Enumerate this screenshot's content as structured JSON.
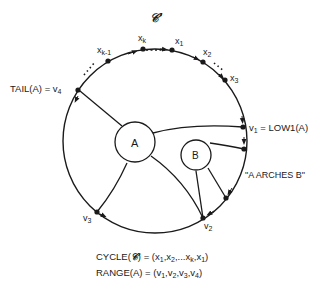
{
  "title": "𝒞′",
  "cycle_nodes": {
    "xk_minus_1": "xk-1",
    "xk": "xk",
    "x1": "x1",
    "x2": "x2",
    "x3": "x3"
  },
  "labels": {
    "tail": "TAIL(A)  =  v4",
    "low1": "v1  =  LOW1(A)",
    "arches": "\"A ARCHES B\"",
    "v2": "v2",
    "v3": "v3",
    "A": "A",
    "B": "B"
  },
  "formulas": {
    "cycle": "CYCLE(𝒞) =  (x1,x2,...xk,x1)",
    "range": "RANGE(A)  =  (v1,v2,v3,v4)"
  },
  "colors": {
    "ink": "#1a1a1a",
    "background": "#ffffff"
  }
}
